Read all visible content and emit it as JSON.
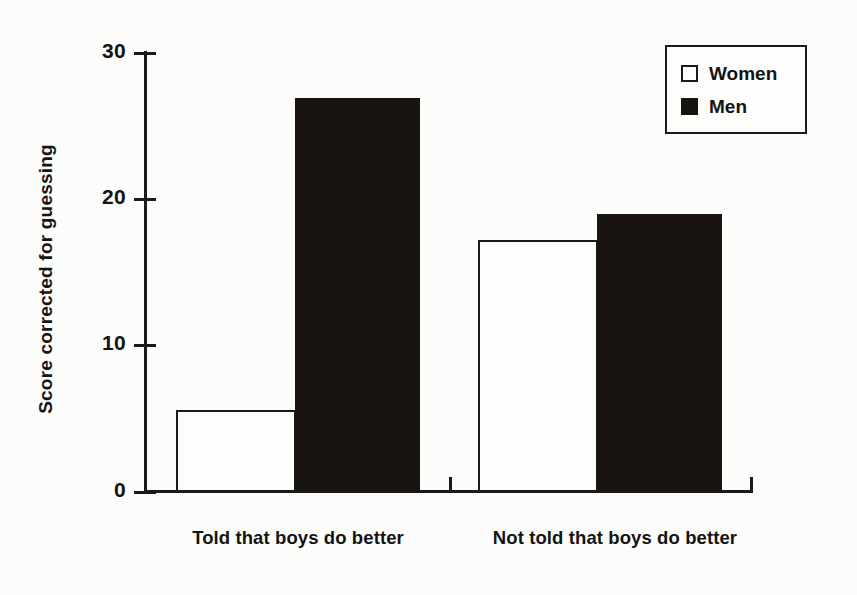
{
  "chart_data": {
    "type": "bar",
    "title": "",
    "subtitle": "",
    "xlabel": "",
    "ylabel": "Score corrected for guessing",
    "categories": [
      "Told that boys do better",
      "Not told that boys do better"
    ],
    "series": [
      {
        "name": "Women",
        "values": [
          5.6,
          17.2
        ],
        "fill": "#ffffff",
        "stroke": "#1a1a1a"
      },
      {
        "name": "Men",
        "values": [
          26.9,
          19.0
        ],
        "fill": "#1a1411",
        "stroke": "#1a1411"
      }
    ],
    "ylim": [
      0,
      30
    ],
    "ytick_values": [
      0,
      10,
      20,
      30
    ],
    "ytick_labels": [
      "0",
      "10",
      "20",
      "30"
    ],
    "grid": false,
    "legend_position": "top-right",
    "annotations": []
  },
  "axes": {
    "y_title": "Score corrected for guessing",
    "ticks": [
      {
        "label": "30",
        "value": 30
      },
      {
        "label": "20",
        "value": 20
      },
      {
        "label": "10",
        "value": 10
      },
      {
        "label": "0",
        "value": 0
      }
    ]
  },
  "categories": {
    "first": "Told that boys do better",
    "second": "Not told that boys do better"
  },
  "legend": {
    "women_label": "Women",
    "men_label": "Men"
  },
  "colors": {
    "ink": "#1a1a1a",
    "fill_black": "#1a1411",
    "fill_white": "#fdfdfb",
    "background": "#fcfcfa"
  }
}
